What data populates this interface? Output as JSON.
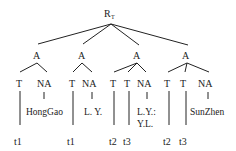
{
  "root": {
    "label": "R",
    "subscript": "T"
  },
  "subtrees": [
    {
      "label": "A",
      "children": [
        {
          "label": "T",
          "leaf": "t1"
        },
        {
          "label": "NA",
          "value": [
            "HongGao"
          ]
        }
      ]
    },
    {
      "label": "A",
      "children": [
        {
          "label": "T",
          "leaf": "t1"
        },
        {
          "label": "NA",
          "value": [
            "L. Y."
          ]
        }
      ]
    },
    {
      "label": "A",
      "children": [
        {
          "label": "T",
          "leaf": "t2"
        },
        {
          "label": "T",
          "leaf": "t3"
        },
        {
          "label": "NA",
          "value": [
            "L.Y.:",
            "Y.L."
          ]
        }
      ]
    },
    {
      "label": "A",
      "children": [
        {
          "label": "T",
          "leaf": "t2"
        },
        {
          "label": "T",
          "leaf": "t3"
        },
        {
          "label": "NA",
          "value": [
            "SunZhen"
          ]
        }
      ]
    }
  ]
}
